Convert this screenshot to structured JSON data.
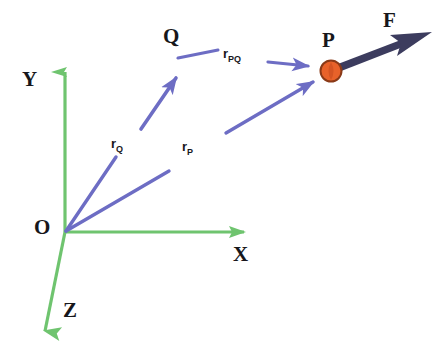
{
  "figure": {
    "background_color": "#ffffff",
    "axis_color": "#6fc46f",
    "vector_color": "#6d6dc4",
    "force_color": "#3c3c5e",
    "point_fill_color": "#e8622a",
    "point_stroke_color": "#8a3a18",
    "label_color": "#17171b"
  },
  "axes": [
    {
      "id": "y-axis",
      "label": "Y",
      "from": [
        65,
        232
      ],
      "to": [
        65,
        58
      ],
      "color": "#6fc46f"
    },
    {
      "id": "x-axis",
      "label": "X",
      "from": [
        65,
        232
      ],
      "to": [
        258,
        232
      ],
      "color": "#6fc46f"
    },
    {
      "id": "z-axis",
      "label": "Z",
      "from": [
        65,
        232
      ],
      "to": [
        41,
        349
      ],
      "color": "#6fc46f"
    }
  ],
  "points": [
    {
      "id": "origin",
      "label": "O",
      "at": [
        65,
        232
      ]
    },
    {
      "id": "point-q",
      "label": "Q",
      "at": [
        178,
        63
      ]
    },
    {
      "id": "point-p",
      "label": "P",
      "at": [
        331,
        71
      ],
      "marker": "filled-circle",
      "radius": 10
    }
  ],
  "vectors": [
    {
      "id": "r-Q",
      "label": "r",
      "subscript": "Q",
      "label_text": "rQ",
      "from": [
        65,
        232
      ],
      "to": [
        178,
        63
      ],
      "color": "#6d6dc4",
      "arrowhead": "at-end",
      "description": "position vector from origin O to point Q"
    },
    {
      "id": "r-P",
      "label": "r",
      "subscript": "P",
      "label_text": "rP",
      "from": [
        65,
        232
      ],
      "to": [
        322,
        78
      ],
      "color": "#6d6dc4",
      "arrowhead": "at-end",
      "description": "position vector from origin O to point P"
    },
    {
      "id": "r-PQ",
      "label": "r",
      "subscript": "PQ",
      "label_text": "rPQ",
      "from": [
        268,
        62
      ],
      "to": [
        322,
        69
      ],
      "color": "#6d6dc4",
      "arrowhead": "at-end",
      "description": "relative position vector from Q to P"
    },
    {
      "id": "force-F",
      "label": "F",
      "label_text": "F",
      "from": [
        333,
        72
      ],
      "to": [
        432,
        33
      ],
      "color": "#3c3c5e",
      "arrowhead": "at-end",
      "description": "force vector F acting at point P"
    }
  ],
  "labels": {
    "axis_y": "Y",
    "axis_x": "X",
    "axis_z": "Z",
    "origin": "O",
    "point_q": "Q",
    "point_p": "P",
    "force": "F",
    "vector_rq_base": "r",
    "vector_rq_sub": "Q",
    "vector_rp_base": "r",
    "vector_rp_sub": "P",
    "vector_rpq_base": "r",
    "vector_rpq_sub": "PQ"
  }
}
